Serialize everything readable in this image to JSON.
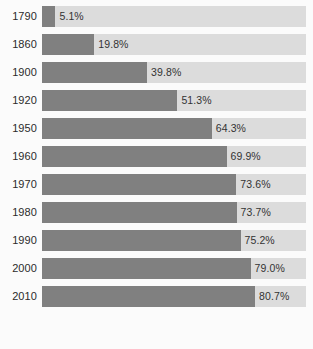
{
  "chart_data": {
    "type": "bar",
    "title": "",
    "subtitle": "",
    "xlabel": "",
    "ylabel": "",
    "orientation": "horizontal",
    "grid": false,
    "legend": null,
    "xlim": [
      0,
      100
    ],
    "categories": [
      "1790",
      "1860",
      "1900",
      "1920",
      "1950",
      "1960",
      "1970",
      "1980",
      "1990",
      "2000",
      "2010"
    ],
    "values": [
      5.1,
      19.8,
      39.8,
      51.3,
      64.3,
      69.9,
      73.6,
      73.7,
      75.2,
      79.0,
      80.7
    ],
    "value_labels": [
      "5.1%",
      "19.8%",
      "39.8%",
      "51.3%",
      "64.3%",
      "69.9%",
      "73.6%",
      "73.7%",
      "75.2%",
      "79.0%",
      "80.7%"
    ],
    "colors": {
      "bar_fill": "#808080",
      "track_background": "#dcdcdc",
      "page_background": "#fbfbfb",
      "category_label": "#2b2b2b",
      "value_label": "#333333"
    }
  },
  "rows": [
    {
      "year": "1790",
      "value": 5.1,
      "label": "5.1%"
    },
    {
      "year": "1860",
      "value": 19.8,
      "label": "19.8%"
    },
    {
      "year": "1900",
      "value": 39.8,
      "label": "39.8%"
    },
    {
      "year": "1920",
      "value": 51.3,
      "label": "51.3%"
    },
    {
      "year": "1950",
      "value": 64.3,
      "label": "64.3%"
    },
    {
      "year": "1960",
      "value": 69.9,
      "label": "69.9%"
    },
    {
      "year": "1970",
      "value": 73.6,
      "label": "73.6%"
    },
    {
      "year": "1980",
      "value": 73.7,
      "label": "73.7%"
    },
    {
      "year": "1990",
      "value": 75.2,
      "label": "75.2%"
    },
    {
      "year": "2000",
      "value": 79.0,
      "label": "79.0%"
    },
    {
      "year": "2010",
      "value": 80.7,
      "label": "80.7%"
    }
  ]
}
